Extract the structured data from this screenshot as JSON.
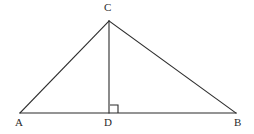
{
  "figure": {
    "name": "triangle-with-altitude",
    "background_color": "#ffffff",
    "stroke_color": "#2b2b2b",
    "stroke_width": 1.1,
    "label_color": "#2b2b2b"
  },
  "points": {
    "A": {
      "label": "A",
      "x": 20,
      "y": 113
    },
    "B": {
      "label": "B",
      "x": 236,
      "y": 113
    },
    "C": {
      "label": "C",
      "x": 109,
      "y": 21
    },
    "D": {
      "label": "D",
      "x": 109,
      "y": 113
    }
  },
  "segments": [
    {
      "name": "side-AC",
      "from": "A",
      "to": "C"
    },
    {
      "name": "side-CB",
      "from": "C",
      "to": "B"
    },
    {
      "name": "base-AB",
      "from": "A",
      "to": "B"
    },
    {
      "name": "altitude-CD",
      "from": "C",
      "to": "D"
    }
  ],
  "right_angle_marker": {
    "name": "right-angle-at-D",
    "at_point": "D",
    "size": 8,
    "orientation": "upper-right"
  },
  "labels": {
    "A": "A",
    "B": "B",
    "C": "C",
    "D": "D"
  }
}
